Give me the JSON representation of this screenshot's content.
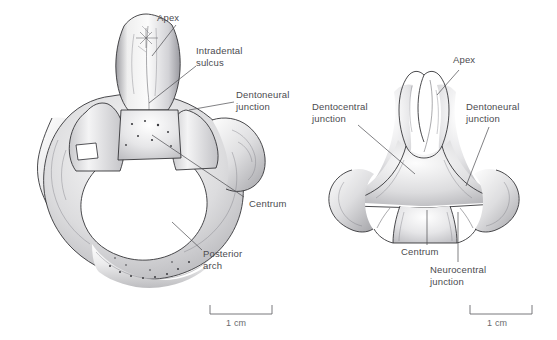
{
  "figure": {
    "background_color": "#ffffff",
    "label_color": "#4b4b4f",
    "outline_color": "#2a2a2e",
    "panels": [
      {
        "id": "left-panel",
        "name": "anterior-view",
        "scale_bar": {
          "caption": "1 cm",
          "length_px": 62
        },
        "labels": [
          {
            "key": "apex",
            "text": "Apex"
          },
          {
            "key": "intradental",
            "text": "Intradental\nsulcus"
          },
          {
            "key": "dentoneural",
            "text": "Dentoneural\njunction"
          },
          {
            "key": "centrum",
            "text": "Centrum"
          },
          {
            "key": "posterior_arch",
            "text": "Posterior\narch"
          }
        ]
      },
      {
        "id": "right-panel",
        "name": "detail-view",
        "scale_bar": {
          "caption": "1 cm",
          "length_px": 62
        },
        "labels": [
          {
            "key": "apex",
            "text": "Apex"
          },
          {
            "key": "dentocentral",
            "text": "Dentocentral\njunction"
          },
          {
            "key": "dentoneural",
            "text": "Dentoneural\njunction"
          },
          {
            "key": "centrum",
            "text": "Centrum"
          },
          {
            "key": "neurocentral",
            "text": "Neurocentral\njunction"
          }
        ]
      }
    ]
  }
}
